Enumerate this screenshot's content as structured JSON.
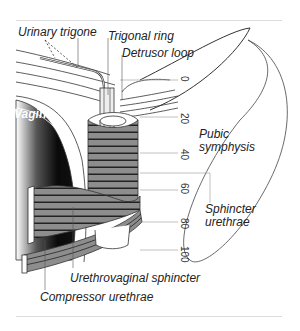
{
  "figure": {
    "labels": {
      "urinary_trigone": "Urinary trigone",
      "trigonal_ring": "Trigonal ring",
      "detrusor_loop": "Detrusor loop",
      "vagina": "Vagina",
      "pubic_symphysis_line1": "Pubic",
      "pubic_symphysis_line2": "symphysis",
      "sphincter_urethrae_line1": "Sphincter",
      "sphincter_urethrae_line2": "urethrae",
      "urethrovaginal_sphincter": "Urethrovaginal sphincter",
      "compressor_urethrae": "Compressor urethrae"
    },
    "scale_ticks": [
      "0",
      "20",
      "40",
      "60",
      "80",
      "100"
    ],
    "colors": {
      "muscle_fill": "#8a8a8a",
      "muscle_stripe": "#2a2a2a",
      "outline": "#333333",
      "vagina_dark": "#111111"
    }
  }
}
